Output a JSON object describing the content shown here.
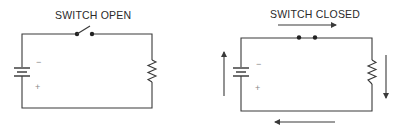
{
  "diagrams": [
    {
      "title": "SWITCH OPEN",
      "switch_state": "open",
      "battery": {
        "negative_label": "−",
        "positive_label": "+"
      },
      "components": [
        "battery",
        "switch",
        "resistor"
      ],
      "current_arrows": []
    },
    {
      "title": "SWITCH CLOSED",
      "switch_state": "closed",
      "battery": {
        "negative_label": "−",
        "positive_label": "+"
      },
      "components": [
        "battery",
        "switch",
        "resistor"
      ],
      "current_arrows": [
        "right-arrow-top",
        "down-arrow-right",
        "left-arrow-bottom",
        "up-arrow-left"
      ]
    }
  ],
  "colors": {
    "line": "#3a3a3a",
    "text": "#2a2a2a",
    "sign": "#888888"
  }
}
